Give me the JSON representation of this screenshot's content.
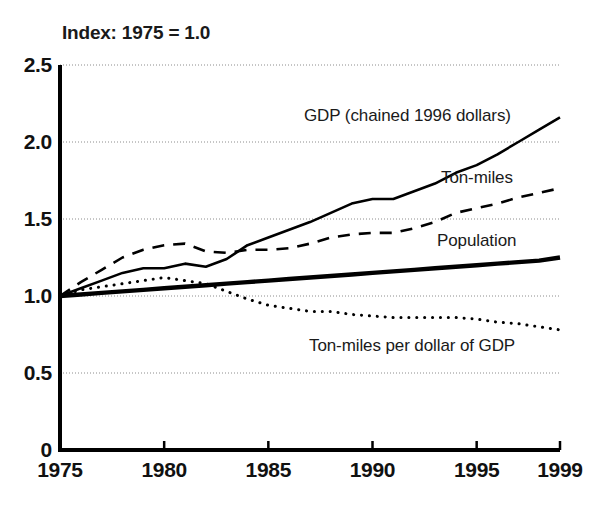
{
  "figure": {
    "subtitle": "Index: 1975 = 1.0",
    "background": "#ffffff",
    "ink": "#000000"
  },
  "axes": {
    "y_ticks": [
      "0",
      "0.5",
      "1.0",
      "1.5",
      "2.0",
      "2.5"
    ],
    "y_tick_values": [
      0,
      0.5,
      1.0,
      1.5,
      2.0,
      2.5
    ],
    "x_ticks": [
      "1975",
      "1980",
      "1985",
      "1990",
      "1995",
      "1999"
    ],
    "x_tick_values": [
      1975,
      1980,
      1985,
      1990,
      1995,
      1999
    ]
  },
  "series_labels": {
    "gdp": "GDP (chained 1996 dollars)",
    "ton_miles": "Ton-miles",
    "population": "Population",
    "intensity": "Ton-miles per dollar of GDP"
  },
  "chart_data": {
    "type": "line",
    "title": "",
    "subtitle": "Index: 1975 = 1.0",
    "xlabel": "",
    "ylabel": "",
    "xlim": [
      1975,
      1999
    ],
    "ylim": [
      0,
      2.5
    ],
    "grid": true,
    "grid_axis": "y",
    "legend": "inline-annotations",
    "x": [
      1975,
      1976,
      1977,
      1978,
      1979,
      1980,
      1981,
      1982,
      1983,
      1984,
      1985,
      1986,
      1987,
      1988,
      1989,
      1990,
      1991,
      1992,
      1993,
      1994,
      1995,
      1996,
      1997,
      1998,
      1999
    ],
    "series": [
      {
        "name": "GDP (chained 1996 dollars)",
        "style": "solid",
        "linewidth": 2.6,
        "color": "#000000",
        "values": [
          1.0,
          1.05,
          1.1,
          1.15,
          1.18,
          1.18,
          1.21,
          1.19,
          1.24,
          1.33,
          1.38,
          1.43,
          1.48,
          1.54,
          1.6,
          1.63,
          1.63,
          1.68,
          1.73,
          1.8,
          1.85,
          1.92,
          2.0,
          2.08,
          2.16
        ]
      },
      {
        "name": "Ton-miles",
        "style": "dashed",
        "linewidth": 2.6,
        "color": "#000000",
        "values": [
          1.0,
          1.09,
          1.17,
          1.25,
          1.3,
          1.33,
          1.34,
          1.29,
          1.28,
          1.3,
          1.3,
          1.31,
          1.34,
          1.38,
          1.4,
          1.41,
          1.41,
          1.44,
          1.48,
          1.54,
          1.57,
          1.6,
          1.64,
          1.67,
          1.7
        ]
      },
      {
        "name": "Population",
        "style": "solid",
        "linewidth": 4.4,
        "color": "#000000",
        "values": [
          1.0,
          1.01,
          1.02,
          1.03,
          1.04,
          1.05,
          1.06,
          1.07,
          1.08,
          1.09,
          1.1,
          1.11,
          1.12,
          1.13,
          1.14,
          1.15,
          1.16,
          1.17,
          1.18,
          1.19,
          1.2,
          1.21,
          1.22,
          1.23,
          1.25
        ]
      },
      {
        "name": "Ton-miles per dollar of GDP",
        "style": "dotted",
        "linewidth": 3.0,
        "color": "#000000",
        "values": [
          1.0,
          1.04,
          1.06,
          1.08,
          1.1,
          1.12,
          1.1,
          1.08,
          1.03,
          0.98,
          0.94,
          0.92,
          0.9,
          0.9,
          0.88,
          0.87,
          0.86,
          0.86,
          0.86,
          0.86,
          0.85,
          0.83,
          0.82,
          0.8,
          0.78
        ]
      }
    ]
  },
  "annotations": [
    {
      "key": "gdp",
      "text": "GDP (chained 1996 dollars)",
      "x": 304,
      "y": 106
    },
    {
      "key": "ton_miles",
      "text": "Ton-miles",
      "x": 441,
      "y": 168
    },
    {
      "key": "population",
      "text": "Population",
      "x": 437,
      "y": 231
    },
    {
      "key": "intensity",
      "text": "Ton-miles per dollar of GDP",
      "x": 309,
      "y": 336
    }
  ]
}
